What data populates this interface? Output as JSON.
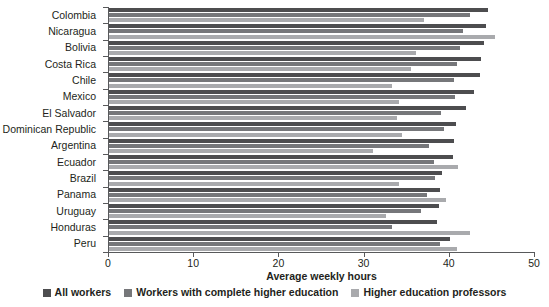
{
  "chart_data": {
    "type": "bar",
    "orientation": "horizontal",
    "title": "",
    "xlabel": "Average weekly hours",
    "ylabel": "",
    "xlim": [
      0,
      50
    ],
    "xticks": [
      0,
      10,
      20,
      30,
      40,
      50
    ],
    "xtick_labels": [
      "0",
      "10",
      "20",
      "30",
      "40",
      "50"
    ],
    "grid": false,
    "legend_position": "bottom",
    "categories": [
      "Colombia",
      "Nicaragua",
      "Bolivia",
      "Costa Rica",
      "Chile",
      "Mexico",
      "El Salvador",
      "Dominican Republic",
      "Argentina",
      "Ecuador",
      "Brazil",
      "Panama",
      "Uruguay",
      "Honduras",
      "Peru"
    ],
    "series": [
      {
        "name": "All workers",
        "color": "#4d4d4f",
        "values": [
          44.5,
          44.3,
          44.0,
          43.7,
          43.6,
          42.8,
          41.9,
          40.7,
          40.5,
          40.4,
          39.1,
          38.9,
          38.7,
          38.5,
          40.0
        ]
      },
      {
        "name": "Workers with complete higher education",
        "color": "#76777a",
        "values": [
          42.4,
          41.5,
          41.2,
          40.9,
          40.5,
          40.6,
          39.0,
          39.3,
          37.6,
          38.1,
          38.3,
          37.3,
          36.6,
          33.2,
          38.9
        ]
      },
      {
        "name": "Higher education professors",
        "color": "#a9aaad",
        "values": [
          37.0,
          45.3,
          36.0,
          35.5,
          33.2,
          34.0,
          33.8,
          34.4,
          31.0,
          41.0,
          34.0,
          39.6,
          32.5,
          42.4,
          40.8
        ]
      }
    ]
  }
}
